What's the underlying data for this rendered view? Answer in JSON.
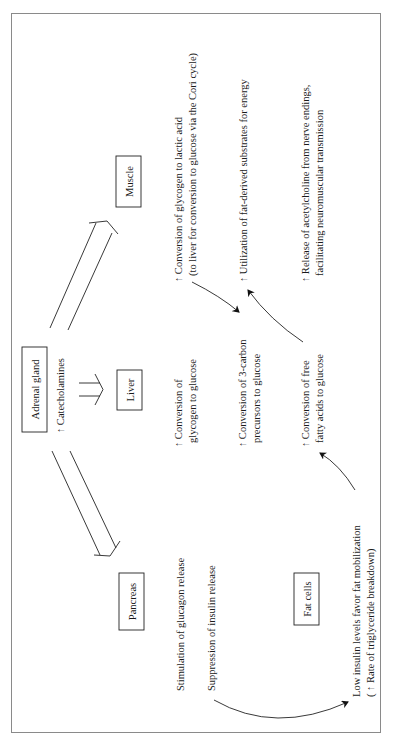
{
  "diagram": {
    "orientation": "rotated-90-ccw",
    "nodes": {
      "adrenal": "Adrenal gland",
      "liver": "Liver",
      "muscle": "Muscle",
      "pancreas": "Pancreas",
      "fat": "Fat cells"
    },
    "catecholamines": "↑ Catecholamines",
    "muscle_effects": {
      "glycogen_line1": "↑ Conversion of glycogen to lactic acid",
      "glycogen_line2": "(to liver for conversion to glucose via the Cori cycle)",
      "utilization": "↑ Utilization of fat-derived substrates for energy",
      "release_line1": "↑ Release of acetylcholine from nerve endings,",
      "release_line2": "facilitating neuromuscular transmission"
    },
    "liver_effects": {
      "glycogen_line1": "↑ Conversion of",
      "glycogen_line2": "glycogen to glucose",
      "threecarbon_line1": "↑ Conversion of 3-carbon",
      "threecarbon_line2": "precursors to glucose",
      "fatty_line1": "↑ Conversion of free",
      "fatty_line2": "fatty acids to glucose"
    },
    "pancreas_effects": {
      "glucagon": "Stimulation of glucagon release",
      "insulin": "Suppression of insulin release"
    },
    "fat_effects": {
      "line1": "Low insulin levels favor fat mobilization",
      "line2": "( ↑ Rate of triglyceride breakdown)"
    }
  }
}
